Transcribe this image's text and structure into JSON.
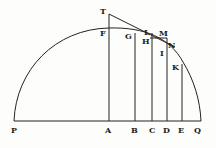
{
  "diagram": {
    "type": "geometric-figure",
    "colors": {
      "ink": "#222222",
      "background": "#fdfdfb"
    },
    "labels": {
      "T": "T",
      "F": "F",
      "G": "G",
      "H": "H",
      "L": "L",
      "M": "M",
      "N": "N",
      "I": "I",
      "K": "K",
      "P": "P",
      "A": "A",
      "B": "B",
      "C": "C",
      "D": "D",
      "E": "E",
      "Q": "Q"
    },
    "base_points": [
      "P",
      "A",
      "B",
      "C",
      "D",
      "E",
      "Q"
    ],
    "curve_points": [
      "F",
      "G",
      "H",
      "I",
      "K"
    ],
    "tangent_points": [
      "T",
      "L",
      "N"
    ],
    "other_points": [
      "M"
    ]
  }
}
